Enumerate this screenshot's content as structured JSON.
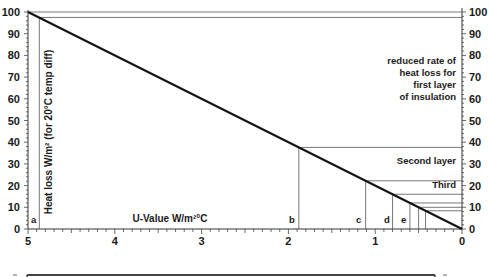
{
  "chart_data": {
    "type": "line",
    "title": "",
    "xlabel": "U-Value W/m²°C",
    "ylabel": "Heat loss W/m² (for 20°C temp diff)",
    "xlim": [
      5,
      0
    ],
    "ylim": [
      0,
      100
    ],
    "x_ticks": [
      "5",
      "4",
      "3",
      "2",
      "1",
      "0"
    ],
    "y_ticks_left": [
      "0",
      "10",
      "20",
      "30",
      "40",
      "50",
      "60",
      "70",
      "80",
      "90",
      "100"
    ],
    "y_ticks_right": [
      "0",
      "10",
      "20",
      "30",
      "40",
      "50",
      "60",
      "70",
      "80",
      "90",
      "100"
    ],
    "grid": false,
    "series": [
      {
        "name": "Heat loss",
        "x": [
          5,
          0
        ],
        "y": [
          100,
          0
        ]
      }
    ],
    "markers": [
      {
        "label": "a",
        "u_value": 4.87,
        "heat_loss": 97.5
      },
      {
        "label": "b",
        "u_value": 1.88,
        "heat_loss": 37.6
      },
      {
        "label": "c",
        "u_value": 1.11,
        "heat_loss": 22.2
      },
      {
        "label": "d",
        "u_value": 0.8,
        "heat_loss": 16.0
      },
      {
        "label": "e",
        "u_value": 0.6,
        "heat_loss": 12.0
      },
      {
        "label": "",
        "u_value": 0.5,
        "heat_loss": 10.0
      },
      {
        "label": "",
        "u_value": 0.42,
        "heat_loss": 8.4
      }
    ],
    "annotations": [
      "reduced rate of heat loss for first layer of insulation",
      "Second layer",
      "Third"
    ]
  },
  "labels": {
    "annotation_first": [
      "reduced rate of",
      "heat loss for",
      "first layer",
      "of insulation"
    ],
    "annotation_second": "Second layer",
    "annotation_third": "Third",
    "marker_a": "a",
    "marker_b": "b",
    "marker_c": "c",
    "marker_d": "d",
    "marker_e": "e",
    "xlabel": "U-Value W/m²°C",
    "ylabel": "Heat loss W/m² (for 20°C temp diff)"
  }
}
